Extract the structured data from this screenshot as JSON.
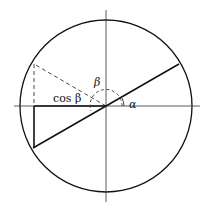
{
  "diagram": {
    "labels": {
      "beta": "β",
      "alpha": "α",
      "cos_beta": "cos β"
    },
    "colors": {
      "stroke": "#111111"
    }
  }
}
